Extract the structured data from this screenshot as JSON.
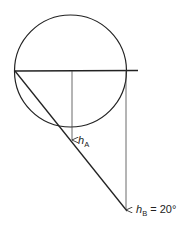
{
  "diagram": {
    "colors": {
      "stroke": "#222222",
      "thin": "#444444",
      "background": "#ffffff"
    },
    "circle": {
      "cx": 70.5,
      "cy": 71,
      "r": 56
    },
    "horizontal_line": {
      "x1": 15,
      "y1": 71,
      "x2": 138,
      "y2": 70.5
    },
    "diagonal_line": {
      "x1": 15,
      "y1": 71,
      "x2": 127,
      "y2": 211
    },
    "arrows": [
      {
        "id": "A",
        "x": 72,
        "y1": 71,
        "y2": 140
      },
      {
        "id": "B",
        "x": 126,
        "y1": 70.5,
        "y2": 210
      }
    ],
    "labels": {
      "hA": {
        "main": "h",
        "sub": "A",
        "suffix": ""
      },
      "hB": {
        "main": "h",
        "sub": "B",
        "suffix": " = 20°"
      }
    }
  }
}
